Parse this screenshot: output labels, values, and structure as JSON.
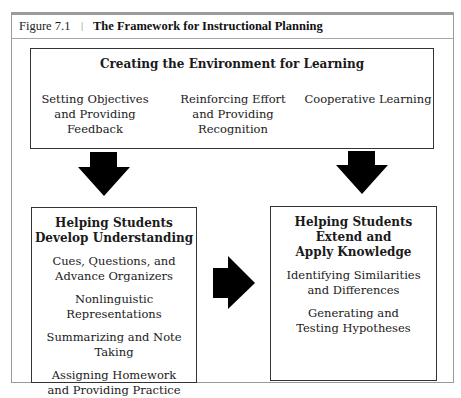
{
  "figure": {
    "label": "Figure 7.1",
    "separator": "|",
    "title": "The Framework for Instructional Planning"
  },
  "top_box": {
    "title": "Creating the Environment for Learning",
    "items": [
      {
        "line1": "Setting Objectives",
        "line2": "and Providing",
        "line3": "Feedback"
      },
      {
        "line1": "Reinforcing Effort",
        "line2": "and Providing",
        "line3": "Recognition"
      },
      {
        "line1": "Cooperative Learning",
        "line2": "",
        "line3": ""
      }
    ]
  },
  "left_box": {
    "title_line1": "Helping Students",
    "title_line2": "Develop Understanding",
    "items": [
      {
        "line1": "Cues, Questions, and",
        "line2": "Advance Organizers"
      },
      {
        "line1": "Nonlinguistic Representations",
        "line2": ""
      },
      {
        "line1": "Summarizing and Note Taking",
        "line2": ""
      },
      {
        "line1": "Assigning Homework",
        "line2": "and Providing Practice"
      }
    ]
  },
  "right_box": {
    "title_line1": "Helping Students",
    "title_line2": "Extend and",
    "title_line3": "Apply Knowledge",
    "items": [
      {
        "line1": "Identifying Similarities",
        "line2": "and Differences"
      },
      {
        "line1": "Generating and",
        "line2": "Testing Hypotheses"
      }
    ]
  },
  "arrows": {
    "color": "#000000",
    "down_left": "arrow-down",
    "down_right": "arrow-down",
    "right": "arrow-right"
  }
}
